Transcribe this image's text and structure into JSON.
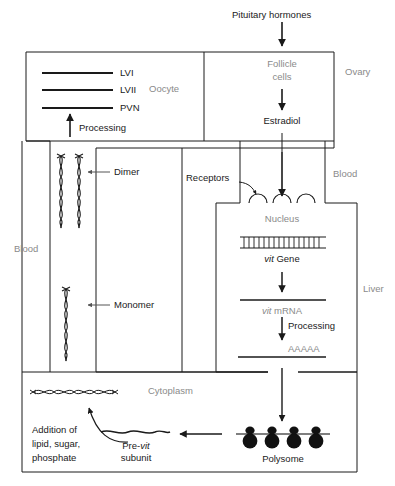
{
  "figure": {
    "type": "biological-pathway-diagram"
  },
  "compartments": {
    "ovary": "Ovary",
    "oocyte": "Oocyte",
    "follicle_cells": "Follicle\ncells",
    "follicle_cells_line1": "Follicle",
    "follicle_cells_line2": "cells",
    "blood_left": "Blood",
    "blood_right": "Blood",
    "liver": "Liver",
    "nucleus": "Nucleus",
    "cytoplasm": "Cytoplasm"
  },
  "nodes": {
    "pituitary_hormones": "Pituitary hormones",
    "estradiol": "Estradiol",
    "receptors": "Receptors",
    "vit_gene_pre": "vit",
    "vit_gene_post": " Gene",
    "vit_mrna_pre": "vit",
    "vit_mrna_post": " mRNA",
    "poly_a_tail": "AAAAA",
    "polysome": "Polysome",
    "pre_vit_subunit_line1_pre": "Pre-",
    "pre_vit_subunit_line1_ital": "vit",
    "pre_vit_subunit_line2": "subunit",
    "addition_line1": "Addition of",
    "addition_line2": "lipid, sugar,",
    "addition_line3": "phosphate",
    "dimer": "Dimer",
    "monomer": "Monomer",
    "lipoprotein_lvi": "LVI",
    "lipoprotein_lvii": "LVII",
    "phosvitin_pvn": "PVN"
  },
  "processes": {
    "processing_liver": "Processing",
    "processing_oocyte": "Processing"
  },
  "colors": {
    "stroke": "#1a1a1a",
    "text_dark": "#1a1a1a",
    "text_gray": "#8a8a8a",
    "background": "#ffffff",
    "ribosome_fill": "#111111"
  }
}
